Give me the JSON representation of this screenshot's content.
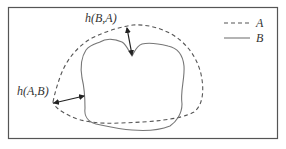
{
  "diagram": {
    "type": "hausdorff-distance-illustration",
    "labels": {
      "h_BA": "h(B,A)",
      "h_AB": "h(A,B)"
    },
    "legend": [
      {
        "name": "A",
        "style": "dashed"
      },
      {
        "name": "B",
        "style": "solid"
      }
    ],
    "colors": {
      "frame": "#555555",
      "curve_A": "#555555",
      "curve_B": "#777777",
      "arrow": "#222222",
      "text": "#333333"
    }
  }
}
